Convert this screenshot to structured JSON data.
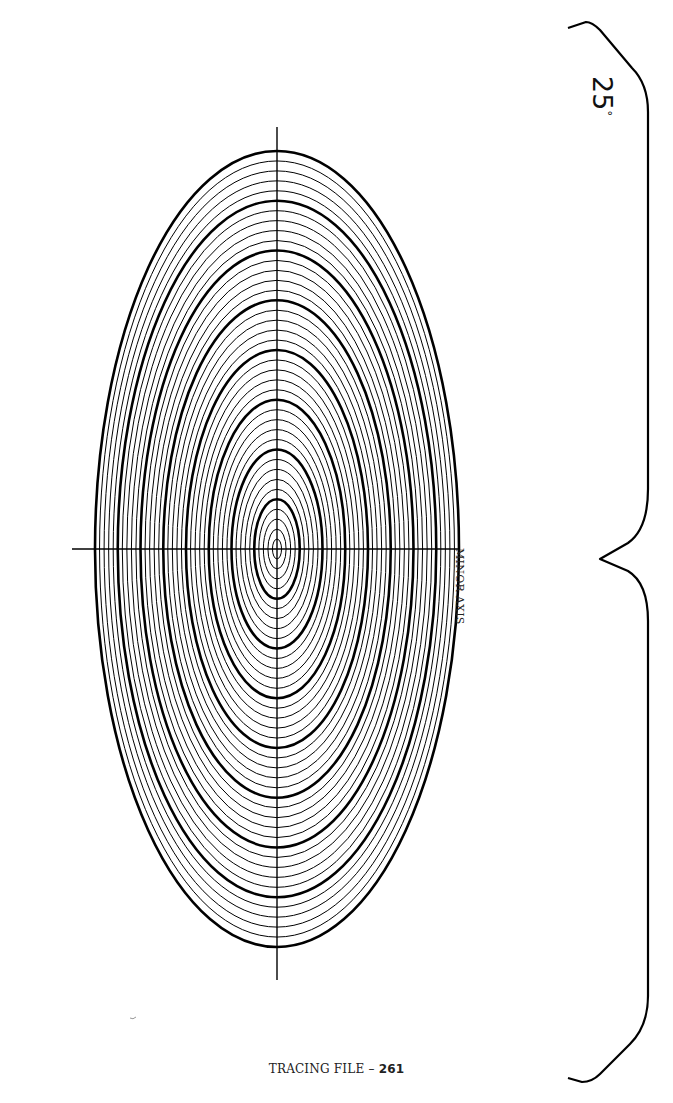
{
  "page": {
    "caption_prefix": "TRACING FILE – ",
    "caption_number": "261",
    "axis_label": "MINOR AXIS",
    "angle_value": "25",
    "angle_unit": "°"
  },
  "ellipse": {
    "center": [
      277,
      549
    ],
    "outer_rx": 182,
    "outer_ry": 398,
    "ratio_ry_over_rx": 2.187,
    "ring_count": 40,
    "bold_every": 5,
    "line_color": "#000000",
    "thin_width": 1.0,
    "bold_width": 2.6
  },
  "axes": {
    "horizontal": {
      "x1": 72,
      "x2": 458,
      "y": 549
    },
    "vertical": {
      "x": 277,
      "y1": 127,
      "y2": 980
    }
  },
  "brace": {
    "x_spine": 648,
    "top": 22,
    "middle": 549,
    "bottom": 1082
  }
}
